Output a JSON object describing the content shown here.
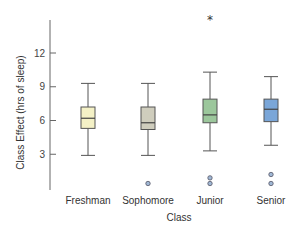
{
  "chart_data": {
    "type": "boxplot",
    "title": "",
    "xlabel": "Class",
    "ylabel": "Class Effect (hrs of sleep)",
    "ylim": [
      0,
      15
    ],
    "yticks": [
      3,
      6,
      9,
      12
    ],
    "ytick_labels": [
      "3",
      "6",
      "9",
      "12"
    ],
    "grid": false,
    "legend": null,
    "categories": [
      "Freshman",
      "Sophomore",
      "Junior",
      "Senior"
    ],
    "series": [
      {
        "name": "Freshman",
        "color": "#f4f1c6",
        "min": 2.9,
        "q1": 5.3,
        "median": 6.2,
        "q3": 7.2,
        "max": 9.3,
        "outliers": [],
        "extreme_outliers": []
      },
      {
        "name": "Sophomore",
        "color": "#cfcdbd",
        "min": 2.9,
        "q1": 5.2,
        "median": 5.8,
        "q3": 7.2,
        "max": 9.3,
        "outliers": [
          0.4
        ],
        "extreme_outliers": []
      },
      {
        "name": "Junior",
        "color": "#9cc79c",
        "min": 3.3,
        "q1": 5.8,
        "median": 6.5,
        "q3": 7.9,
        "max": 10.3,
        "outliers": [
          0.9,
          0.4
        ],
        "extreme_outliers": [
          14.9
        ]
      },
      {
        "name": "Senior",
        "color": "#7aa6d8",
        "min": 3.8,
        "q1": 5.9,
        "median": 7.0,
        "q3": 7.9,
        "max": 9.9,
        "outliers": [
          1.2,
          0.4
        ],
        "extreme_outliers": []
      }
    ]
  }
}
